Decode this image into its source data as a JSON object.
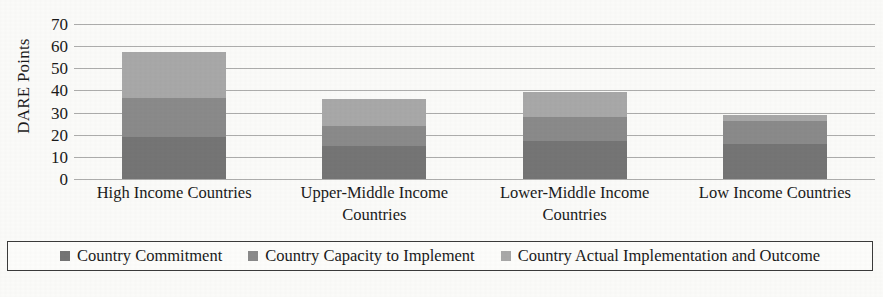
{
  "chart_data": {
    "type": "bar",
    "subtype": "stacked-bar",
    "title": "",
    "xlabel": "",
    "ylabel": "DARE Points",
    "ylim": [
      0,
      70
    ],
    "ytick_step": 10,
    "yticks": [
      70,
      60,
      50,
      40,
      30,
      20,
      10,
      0
    ],
    "grid": "horizontal",
    "legend_position": "bottom",
    "categories": [
      "High Income Countries",
      "Upper-Middle Income Countries",
      "Lower-Middle Income Countries",
      "Low Income Countries"
    ],
    "series": [
      {
        "name": "Country Commitment",
        "color": "#757575",
        "values": [
          19,
          15,
          17,
          16
        ]
      },
      {
        "name": "Country Capacity to Implement",
        "color": "#8a8a8a",
        "values": [
          17.5,
          9,
          11,
          10
        ]
      },
      {
        "name": "Country Actual Implementation and Outcome",
        "color": "#a8a8a8",
        "values": [
          21,
          12,
          11.5,
          3
        ]
      }
    ],
    "totals": [
      57.5,
      36,
      39.5,
      29
    ]
  },
  "axis": {
    "y_title": "DARE Points",
    "y_ticks": [
      "70",
      "60",
      "50",
      "40",
      "30",
      "20",
      "10",
      "0"
    ]
  },
  "x_labels": [
    "High Income Countries",
    "Upper-Middle Income Countries",
    "Lower-Middle Income Countries",
    "Low Income Countries"
  ],
  "legend": {
    "items": [
      {
        "label": "Country Commitment",
        "color": "#757575"
      },
      {
        "label": "Country Capacity to Implement",
        "color": "#8a8a8a"
      },
      {
        "label": "Country Actual Implementation and Outcome",
        "color": "#a8a8a8"
      }
    ]
  },
  "colors": {
    "commitment": "#757575",
    "capacity": "#8a8a8a",
    "actual": "#a8a8a8",
    "gridline": "#9b9b9b",
    "background": "#fbfbf9",
    "legend_border": "#3a3a3a"
  }
}
